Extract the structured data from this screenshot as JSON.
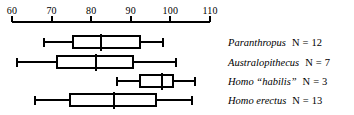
{
  "chart_data": {
    "type": "box",
    "title": "",
    "xlabel": "",
    "ylabel": "",
    "xlim": [
      60,
      110
    ],
    "xticks": [
      60,
      70,
      80,
      90,
      100,
      110
    ],
    "xtick_labels": [
      "60",
      "70",
      "80",
      "90",
      "100",
      "110"
    ],
    "grid": false,
    "legend_position": "right",
    "orientation": "horizontal",
    "categories": [
      "Paranthropus",
      "Australopithecus",
      "Homo “habilis”",
      "Homo erectus"
    ],
    "boxes": [
      {
        "label": "Paranthropus",
        "n": 12,
        "min": 68.0,
        "q1": 75.4,
        "median": 82.5,
        "q3": 92.3,
        "max": 98.1
      },
      {
        "label": "Australopithecus",
        "n": 7,
        "min": 61.3,
        "q1": 71.4,
        "median": 81.2,
        "q3": 90.6,
        "max": 101.4
      },
      {
        "label": "Homo “habilis”",
        "n": 3,
        "min": 86.5,
        "q1": 92.3,
        "median": 97.9,
        "q3": 100.7,
        "max": 106.2
      },
      {
        "label": "Homo erectus",
        "n": 13,
        "min": 65.8,
        "q1": 74.6,
        "median": 85.8,
        "q3": 96.4,
        "max": 105.5
      }
    ],
    "line_color": "#000000",
    "box_fill": "#ffffff"
  },
  "axis": {
    "ticks": [
      {
        "value": 60,
        "label": "60"
      },
      {
        "value": 70,
        "label": "70"
      },
      {
        "value": 80,
        "label": "80"
      },
      {
        "value": 90,
        "label": "90"
      },
      {
        "value": 100,
        "label": "100"
      },
      {
        "value": 110,
        "label": "110"
      }
    ]
  },
  "legend": {
    "rows": [
      {
        "name": "Paranthropus",
        "n_text": "N",
        "eq": "=",
        "n_value": "12"
      },
      {
        "name": "Australopithecus",
        "n_text": "N",
        "eq": "=",
        "n_value": "7"
      },
      {
        "name": "Homo “habilis”",
        "n_text": "N",
        "eq": "=",
        "n_value": "3"
      },
      {
        "name": "Homo erectus",
        "n_text": "N",
        "eq": "=",
        "n_value": "13"
      }
    ]
  }
}
